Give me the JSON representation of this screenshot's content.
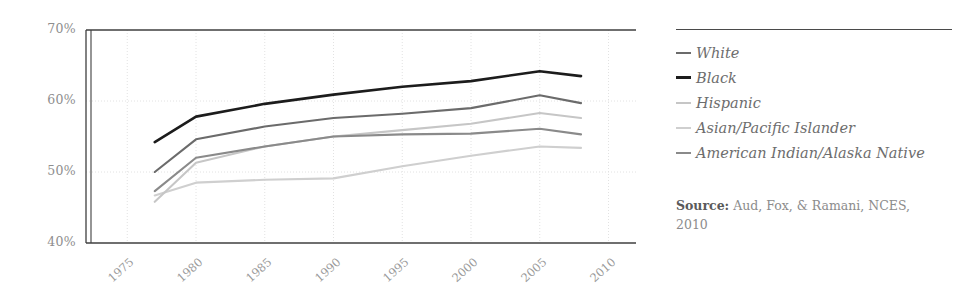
{
  "chart_data": {
    "type": "line",
    "title": "",
    "xlabel": "",
    "ylabel": "",
    "xlim": [
      1972,
      2012
    ],
    "ylim": [
      40,
      70
    ],
    "grid": true,
    "y_tick_labels": [
      "70%",
      "60%",
      "50%",
      "40%"
    ],
    "y_ticks": [
      70,
      60,
      50,
      40
    ],
    "x_tick_labels": [
      "1975",
      "1980",
      "1985",
      "1990",
      "1995",
      "2000",
      "2005",
      "2010"
    ],
    "x_ticks": [
      1975,
      1980,
      1985,
      1990,
      1995,
      2000,
      2005,
      2010
    ],
    "value_suffix": "%",
    "legend_position": "right",
    "x": [
      1977,
      1980,
      1985,
      1990,
      1995,
      2000,
      2005,
      2008
    ],
    "series": [
      {
        "name": "White",
        "color": "#6b6b6b",
        "width": 2.1,
        "values": [
          50.0,
          54.6,
          56.4,
          57.6,
          58.2,
          59.0,
          60.8,
          59.7
        ]
      },
      {
        "name": "Black",
        "color": "#1c1c1c",
        "width": 2.6,
        "values": [
          54.2,
          57.8,
          59.6,
          60.9,
          62.0,
          62.8,
          64.2,
          63.5
        ]
      },
      {
        "name": "Hispanic",
        "color": "#c6c6c6",
        "width": 2.1,
        "values": [
          45.8,
          51.3,
          53.6,
          55.0,
          55.9,
          56.8,
          58.3,
          57.6
        ]
      },
      {
        "name": "Asian/Pacific Islander",
        "color": "#cfcfcf",
        "width": 2.1,
        "values": [
          46.7,
          48.5,
          48.9,
          49.1,
          50.8,
          52.3,
          53.6,
          53.4
        ]
      },
      {
        "name": "American Indian/Alaska Native",
        "color": "#8a8a8a",
        "width": 2.1,
        "values": [
          47.3,
          52.0,
          53.6,
          55.0,
          55.3,
          55.4,
          56.1,
          55.3
        ]
      }
    ]
  },
  "legend": {
    "items": [
      {
        "label": "White",
        "swatch_color": "#6b6b6b",
        "swatch_weight": 2.4
      },
      {
        "label": "Black",
        "swatch_color": "#1c1c1c",
        "swatch_weight": 3.2
      },
      {
        "label": "Hispanic",
        "swatch_color": "#c6c6c6",
        "swatch_weight": 2.2
      },
      {
        "label": "Asian/Pacific Islander",
        "swatch_color": "#cfcfcf",
        "swatch_weight": 2.2
      },
      {
        "label": "American Indian/Alaska Native",
        "swatch_color": "#8a8a8a",
        "swatch_weight": 2.6
      }
    ]
  },
  "source": {
    "label": "Source:",
    "text": " Aud, Fox, & Ramani, NCES, 2010"
  },
  "style": {
    "axis_color": "#3f3f3f",
    "grid_color": "#e2e2e2",
    "tick_text_color": "#9a9a9a",
    "background": "#ffffff"
  }
}
